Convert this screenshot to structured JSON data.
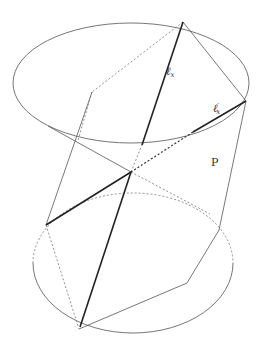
{
  "figure": {
    "type": "geometric-diagram",
    "labels": {
      "line_main": "ℓ",
      "line_main_sub": "x",
      "line_secondary": "ℓ",
      "line_secondary_prime": "′",
      "line_secondary_sub": "x",
      "plane": "P"
    },
    "colors": {
      "stroke": "#555555",
      "bold_stroke": "#222222",
      "background": "#ffffff"
    }
  }
}
